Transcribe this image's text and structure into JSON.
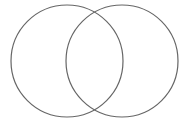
{
  "diagram": {
    "type": "venn",
    "background": "#ffffff",
    "stroke_color": "#666666",
    "circles": [
      {
        "name": "left-set",
        "cx": 67,
        "cy": 61,
        "r": 56
      },
      {
        "name": "right-set",
        "cx": 122,
        "cy": 61,
        "r": 56
      }
    ]
  }
}
